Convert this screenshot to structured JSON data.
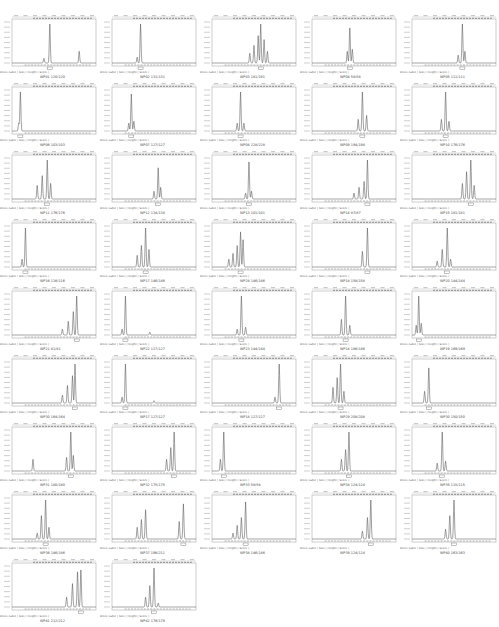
{
  "figure": {
    "legend_line": "Allele Label  |  Size  |  Height  |  Score  |",
    "columns": 5,
    "rows": 9
  },
  "chart_data": [
    {
      "type": "line",
      "title": "WP01 120/120",
      "peaks": [
        [
          0.38,
          0.12
        ],
        [
          0.45,
          1.0
        ],
        [
          0.8,
          0.3
        ]
      ],
      "ylim": [
        0,
        900
      ]
    },
    {
      "type": "line",
      "title": "WP02 131/131",
      "peaks": [
        [
          0.3,
          0.15
        ],
        [
          0.34,
          1.0
        ]
      ],
      "ylim": [
        0,
        10000
      ]
    },
    {
      "type": "line",
      "title": "WP03 181/191",
      "peaks": [
        [
          0.45,
          0.25
        ],
        [
          0.5,
          0.45
        ],
        [
          0.55,
          0.7
        ],
        [
          0.58,
          1.0
        ],
        [
          0.62,
          0.6
        ],
        [
          0.66,
          0.3
        ]
      ],
      "ylim": [
        0,
        1300
      ]
    },
    {
      "type": "line",
      "title": "WP04 58/58",
      "peaks": [
        [
          0.42,
          0.3
        ],
        [
          0.45,
          0.9
        ],
        [
          0.48,
          0.35
        ]
      ],
      "ylim": [
        0,
        1000
      ]
    },
    {
      "type": "line",
      "title": "WP05 111/111",
      "peaks": [
        [
          0.55,
          0.2
        ],
        [
          0.6,
          1.0
        ],
        [
          0.63,
          0.3
        ]
      ],
      "ylim": [
        0,
        2000
      ]
    },
    {
      "type": "line",
      "title": "WP06 103/103",
      "peaks": [
        [
          0.08,
          0.2
        ],
        [
          0.1,
          1.0
        ]
      ],
      "ylim": [
        0,
        17000
      ]
    },
    {
      "type": "line",
      "title": "WP07 127/127",
      "peaks": [
        [
          0.2,
          0.2
        ],
        [
          0.23,
          0.95
        ],
        [
          0.26,
          0.25
        ]
      ],
      "ylim": [
        0,
        1000
      ]
    },
    {
      "type": "line",
      "title": "WP08 228/228",
      "peaks": [
        [
          0.3,
          0.2
        ],
        [
          0.34,
          1.0
        ],
        [
          0.38,
          0.2
        ]
      ],
      "ylim": [
        0,
        18000
      ]
    },
    {
      "type": "line",
      "title": "WP09 194/194",
      "peaks": [
        [
          0.55,
          0.3
        ],
        [
          0.6,
          1.0
        ],
        [
          0.65,
          0.4
        ]
      ],
      "ylim": [
        0,
        3000
      ]
    },
    {
      "type": "line",
      "title": "WP10 176/176",
      "peaks": [
        [
          0.35,
          0.3
        ],
        [
          0.4,
          1.0
        ],
        [
          0.44,
          0.25
        ]
      ],
      "ylim": [
        0,
        10000
      ]
    },
    {
      "type": "line",
      "title": "WP11 176/176",
      "peaks": [
        [
          0.3,
          0.35
        ],
        [
          0.36,
          0.6
        ],
        [
          0.42,
          1.0
        ],
        [
          0.46,
          0.4
        ]
      ],
      "ylim": [
        0,
        1400
      ]
    },
    {
      "type": "line",
      "title": "WP12 134/134",
      "peaks": [
        [
          0.5,
          0.2
        ],
        [
          0.55,
          0.8
        ],
        [
          0.58,
          0.3
        ]
      ],
      "ylim": [
        0,
        4000
      ]
    },
    {
      "type": "line",
      "title": "WP13 101/101",
      "peaks": [
        [
          0.4,
          0.15
        ],
        [
          0.44,
          0.95
        ],
        [
          0.47,
          0.2
        ]
      ],
      "ylim": [
        0,
        12000
      ]
    },
    {
      "type": "line",
      "title": "WP14 87/87",
      "peaks": [
        [
          0.5,
          0.15
        ],
        [
          0.56,
          0.3
        ],
        [
          0.62,
          0.45
        ],
        [
          0.66,
          1.0
        ]
      ],
      "ylim": [
        0,
        14000
      ]
    },
    {
      "type": "line",
      "title": "WP15 181/181",
      "peaks": [
        [
          0.6,
          0.4
        ],
        [
          0.65,
          0.7
        ],
        [
          0.7,
          1.0
        ],
        [
          0.74,
          0.35
        ]
      ],
      "ylim": [
        0,
        1800
      ]
    },
    {
      "type": "line",
      "title": "WP16 116/116",
      "peaks": [
        [
          0.12,
          0.2
        ],
        [
          0.16,
          1.0
        ]
      ],
      "ylim": [
        0,
        17000
      ]
    },
    {
      "type": "line",
      "title": "WP17 146/146",
      "peaks": [
        [
          0.3,
          0.3
        ],
        [
          0.35,
          0.55
        ],
        [
          0.4,
          1.0
        ],
        [
          0.44,
          0.45
        ]
      ],
      "ylim": [
        0,
        1400
      ]
    },
    {
      "type": "line",
      "title": "WP28 146/146",
      "peaks": [
        [
          0.2,
          0.2
        ],
        [
          0.25,
          0.35
        ],
        [
          0.3,
          0.55
        ],
        [
          0.34,
          0.9
        ],
        [
          0.37,
          0.7
        ]
      ],
      "ylim": [
        0,
        22000
      ]
    },
    {
      "type": "line",
      "title": "WP18 158/158",
      "peaks": [
        [
          0.6,
          0.4
        ],
        [
          0.66,
          1.0
        ]
      ],
      "ylim": [
        0,
        3000
      ]
    },
    {
      "type": "line",
      "title": "WP20 144/144",
      "peaks": [
        [
          0.3,
          0.15
        ],
        [
          0.36,
          0.45
        ],
        [
          0.42,
          1.0
        ],
        [
          0.46,
          0.2
        ]
      ],
      "ylim": [
        0,
        4000
      ]
    },
    {
      "type": "line",
      "title": "WP21 81/81",
      "peaks": [
        [
          0.6,
          0.15
        ],
        [
          0.67,
          0.35
        ],
        [
          0.73,
          0.6
        ],
        [
          0.77,
          1.0
        ]
      ],
      "ylim": [
        0,
        3500
      ]
    },
    {
      "type": "line",
      "title": "WP22 127/127",
      "peaks": [
        [
          0.12,
          0.15
        ],
        [
          0.16,
          1.0
        ],
        [
          0.45,
          0.07
        ]
      ],
      "ylim": [
        0,
        18000
      ]
    },
    {
      "type": "line",
      "title": "WP23 144/144",
      "peaks": [
        [
          0.3,
          0.15
        ],
        [
          0.35,
          1.0
        ],
        [
          0.4,
          0.2
        ]
      ],
      "ylim": [
        0,
        7000
      ]
    },
    {
      "type": "line",
      "title": "WP18 186/186",
      "peaks": [
        [
          0.35,
          0.4
        ],
        [
          0.4,
          1.0
        ],
        [
          0.45,
          0.25
        ]
      ],
      "ylim": [
        0,
        2500
      ]
    },
    {
      "type": "line",
      "title": "WP19 169/169",
      "peaks": [
        [
          0.05,
          0.25
        ],
        [
          0.08,
          1.0
        ],
        [
          0.11,
          0.3
        ]
      ],
      "ylim": [
        0,
        1800
      ]
    },
    {
      "type": "line",
      "title": "WP30 164/164",
      "peaks": [
        [
          0.6,
          0.2
        ],
        [
          0.66,
          0.45
        ],
        [
          0.72,
          0.7
        ],
        [
          0.75,
          1.0
        ]
      ],
      "ylim": [
        0,
        3000
      ]
    },
    {
      "type": "line",
      "title": "WP17 127/127",
      "peaks": [
        [
          0.12,
          0.15
        ],
        [
          0.16,
          1.0
        ],
        [
          0.5,
          0.06
        ]
      ],
      "ylim": [
        0,
        22000
      ]
    },
    {
      "type": "line",
      "title": "WP18 127/127",
      "peaks": [
        [
          0.75,
          0.15
        ],
        [
          0.8,
          1.0
        ]
      ],
      "ylim": [
        0,
        600
      ]
    },
    {
      "type": "line",
      "title": "WP29 208/208",
      "peaks": [
        [
          0.25,
          0.4
        ],
        [
          0.3,
          0.65
        ],
        [
          0.34,
          1.0
        ],
        [
          0.38,
          0.3
        ]
      ],
      "ylim": [
        0,
        2000
      ]
    },
    {
      "type": "line",
      "title": "WP30 150/150",
      "peaks": [
        [
          0.15,
          0.3
        ],
        [
          0.2,
          0.9
        ]
      ],
      "ylim": [
        0,
        2500
      ]
    },
    {
      "type": "line",
      "title": "WP31 180/180",
      "peaks": [
        [
          0.25,
          0.3
        ],
        [
          0.65,
          0.35
        ],
        [
          0.7,
          1.0
        ],
        [
          0.73,
          0.4
        ]
      ],
      "ylim": [
        0,
        3000
      ]
    },
    {
      "type": "line",
      "title": "WP32 175/175",
      "peaks": [
        [
          0.65,
          0.3
        ],
        [
          0.7,
          0.6
        ],
        [
          0.74,
          1.0
        ]
      ],
      "ylim": [
        0,
        23000
      ]
    },
    {
      "type": "line",
      "title": "WP33 58/58",
      "peaks": [
        [
          0.1,
          0.3
        ],
        [
          0.14,
          1.0
        ]
      ],
      "ylim": [
        0,
        1000
      ]
    },
    {
      "type": "line",
      "title": "WP34 124/124",
      "peaks": [
        [
          0.35,
          0.3
        ],
        [
          0.4,
          0.55
        ],
        [
          0.44,
          1.0
        ]
      ],
      "ylim": [
        0,
        18000
      ]
    },
    {
      "type": "line",
      "title": "WP35 115/115",
      "peaks": [
        [
          0.3,
          0.2
        ],
        [
          0.36,
          1.0
        ],
        [
          0.4,
          0.25
        ]
      ],
      "ylim": [
        0,
        2500
      ]
    },
    {
      "type": "line",
      "title": "WP36 186/186",
      "peaks": [
        [
          0.3,
          0.15
        ],
        [
          0.35,
          0.6
        ],
        [
          0.4,
          1.0
        ],
        [
          0.44,
          0.3
        ]
      ],
      "ylim": [
        0,
        35000
      ]
    },
    {
      "type": "line",
      "title": "WP37 196/211",
      "peaks": [
        [
          0.3,
          0.3
        ],
        [
          0.35,
          0.5
        ],
        [
          0.4,
          0.75
        ],
        [
          0.8,
          0.45
        ],
        [
          0.85,
          0.9
        ]
      ],
      "ylim": [
        0,
        3000
      ]
    },
    {
      "type": "line",
      "title": "WP38 146/146",
      "peaks": [
        [
          0.25,
          0.15
        ],
        [
          0.3,
          0.35
        ],
        [
          0.35,
          0.55
        ],
        [
          0.4,
          0.95
        ]
      ],
      "ylim": [
        0,
        3000
      ]
    },
    {
      "type": "line",
      "title": "WP39 124/124",
      "peaks": [
        [
          0.6,
          0.2
        ],
        [
          0.66,
          0.55
        ],
        [
          0.7,
          1.0
        ]
      ],
      "ylim": [
        0,
        2000
      ]
    },
    {
      "type": "line",
      "title": "WP40 163/163",
      "peaks": [
        [
          0.4,
          0.25
        ],
        [
          0.45,
          0.6
        ],
        [
          0.5,
          1.0
        ]
      ],
      "ylim": [
        0,
        3000
      ]
    },
    {
      "type": "line",
      "title": "WP41 212/212",
      "peaks": [
        [
          0.65,
          0.25
        ],
        [
          0.72,
          0.6
        ],
        [
          0.78,
          0.9
        ],
        [
          0.82,
          0.95
        ]
      ],
      "ylim": [
        0,
        2500
      ]
    },
    {
      "type": "line",
      "title": "WP42 179/179",
      "peaks": [
        [
          0.4,
          0.25
        ],
        [
          0.45,
          0.55
        ],
        [
          0.5,
          1.0
        ],
        [
          0.55,
          0.1
        ]
      ],
      "ylim": [
        0,
        800
      ]
    }
  ]
}
